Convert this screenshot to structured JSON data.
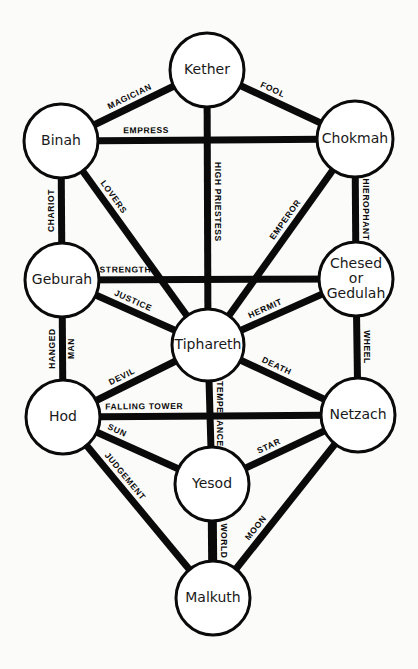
{
  "colors": {
    "ink": "#0a0a0a",
    "paper": "#fbfbf9",
    "node_fill": "#ffffff"
  },
  "nodes": [
    {
      "id": "kether",
      "label": [
        "Kether"
      ],
      "cx": 207,
      "cy": 70,
      "r": 37
    },
    {
      "id": "binah",
      "label": [
        "Binah"
      ],
      "cx": 61,
      "cy": 141,
      "r": 37
    },
    {
      "id": "chokmah",
      "label": [
        "Chokmah"
      ],
      "cx": 355,
      "cy": 139,
      "r": 38
    },
    {
      "id": "geburah",
      "label": [
        "Geburah"
      ],
      "cx": 62,
      "cy": 280,
      "r": 37
    },
    {
      "id": "chesed",
      "label": [
        "Chesed",
        "or",
        "Gedulah"
      ],
      "cx": 356,
      "cy": 279,
      "r": 37
    },
    {
      "id": "tiphareth",
      "label": [
        "Tiphareth"
      ],
      "cx": 208,
      "cy": 345,
      "r": 36
    },
    {
      "id": "hod",
      "label": [
        "Hod"
      ],
      "cx": 63,
      "cy": 417,
      "r": 37
    },
    {
      "id": "netzach",
      "label": [
        "Netzach"
      ],
      "cx": 358,
      "cy": 415,
      "r": 37
    },
    {
      "id": "yesod",
      "label": [
        "Yesod"
      ],
      "cx": 212,
      "cy": 484,
      "r": 37
    },
    {
      "id": "malkuth",
      "label": [
        "Malkuth"
      ],
      "cx": 213,
      "cy": 598,
      "r": 37
    }
  ],
  "paths": [
    {
      "name": "MAGICIAN",
      "from": "binah",
      "to": "kether",
      "width": 7,
      "label_pos": 0.5,
      "side": -1
    },
    {
      "name": "FOOL",
      "from": "kether",
      "to": "chokmah",
      "width": 7,
      "label_pos": 0.35,
      "side": -1
    },
    {
      "name": "EMPRESS",
      "from": "binah",
      "to": "chokmah",
      "width": 7,
      "label_pos": 0.22,
      "side": -1
    },
    {
      "name": "HIGH PRIESTESS",
      "from": "kether",
      "to": "tiphareth",
      "width": 7,
      "label_pos": 0.47,
      "side": 1
    },
    {
      "name": "CHARIOT",
      "from": "geburah",
      "to": "binah",
      "width": 7,
      "label_pos": 0.5,
      "side": -1
    },
    {
      "name": "LOVERS",
      "from": "binah",
      "to": "tiphareth",
      "width": 7,
      "label_pos": 0.22,
      "side": -1
    },
    {
      "name": "HIEROPHANT",
      "from": "chokmah",
      "to": "chesed",
      "width": 7,
      "label_pos": 0.5,
      "side": 1
    },
    {
      "name": "EMPEROR",
      "from": "tiphareth",
      "to": "chokmah",
      "width": 7,
      "label_pos": 0.62,
      "side": -1
    },
    {
      "name": "STRENGTH",
      "from": "geburah",
      "to": "chesed",
      "width": 7,
      "label_pos": 0.12,
      "side": -1
    },
    {
      "name": "JUSTICE",
      "from": "geburah",
      "to": "tiphareth",
      "width": 7,
      "label_pos": 0.42,
      "side": -1
    },
    {
      "name": "HERMIT",
      "from": "tiphareth",
      "to": "chesed",
      "width": 7,
      "label_pos": 0.35,
      "side": -1
    },
    {
      "name": "WHEEL",
      "from": "chesed",
      "to": "netzach",
      "width": 7,
      "label_pos": 0.5,
      "side": 1
    },
    {
      "name": "HANGED MAN",
      "from": "hod",
      "to": "geburah",
      "width": 7,
      "label_pos": 0.5,
      "side": 0,
      "two_line": [
        "HANGED",
        "MAN"
      ]
    },
    {
      "name": "DEVIL",
      "from": "hod",
      "to": "tiphareth",
      "width": 7,
      "label_pos": 0.38,
      "side": -1
    },
    {
      "name": "DEATH",
      "from": "tiphareth",
      "to": "netzach",
      "width": 7,
      "label_pos": 0.38,
      "side": -1
    },
    {
      "name": "TEMPERANCE",
      "from": "tiphareth",
      "to": "yesod",
      "width": 7,
      "label_pos": 0.5,
      "side": 1
    },
    {
      "name": "FALLING TOWER",
      "from": "hod",
      "to": "netzach",
      "width": 7,
      "label_pos": 0.2,
      "side": -1
    },
    {
      "name": "SUN",
      "from": "hod",
      "to": "yesod",
      "width": 7,
      "label_pos": 0.2,
      "side": -1
    },
    {
      "name": "STAR",
      "from": "yesod",
      "to": "netzach",
      "width": 7,
      "label_pos": 0.35,
      "side": -1
    },
    {
      "name": "JUDGEMENT",
      "from": "hod",
      "to": "malkuth",
      "width": 7,
      "label_pos": 0.3,
      "side": -1
    },
    {
      "name": "WORLD",
      "from": "yesod",
      "to": "malkuth",
      "width": 9,
      "label_pos": 0.5,
      "side": 1
    },
    {
      "name": "MOON",
      "from": "malkuth",
      "to": "netzach",
      "width": 7,
      "label_pos": 0.28,
      "side": -1
    }
  ]
}
